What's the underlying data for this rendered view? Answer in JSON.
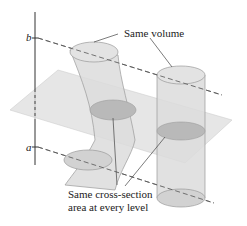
{
  "diagram": {
    "axis_labels": {
      "top": "b",
      "bottom": "a"
    },
    "annotations": {
      "volume": "Same volume",
      "cross_section_line1": "Same cross-section",
      "cross_section_line2": "area at every level"
    },
    "colors": {
      "solid_fill": "#d9d9d9",
      "solid_stroke": "#9a9a9a",
      "plane_fill": "#e4e4e4",
      "cross_section_fill": "#b8b8b8",
      "line": "#444444"
    }
  }
}
